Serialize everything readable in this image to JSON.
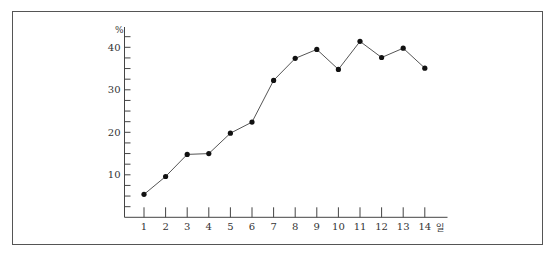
{
  "chart_data": {
    "type": "line",
    "title": "",
    "xlabel": "일",
    "ylabel": "%",
    "categories": [
      "1",
      "2",
      "3",
      "4",
      "5",
      "6",
      "7",
      "8",
      "9",
      "10",
      "11",
      "12",
      "13",
      "14"
    ],
    "x": [
      1,
      2,
      3,
      4,
      5,
      6,
      7,
      8,
      9,
      10,
      11,
      12,
      13,
      14
    ],
    "values": [
      5.4,
      9.6,
      14.8,
      15.0,
      19.8,
      22.4,
      32.2,
      37.4,
      39.5,
      34.8,
      41.4,
      37.6,
      39.8,
      35.1
    ],
    "y_ticks_labeled": [
      10,
      20,
      30,
      40
    ],
    "y_minor_tick_step": 2.5,
    "ylim": [
      0,
      44
    ],
    "xlim": [
      0,
      15
    ],
    "grid": false,
    "legend": null,
    "marker": "filled-circle",
    "line_color": "#555555",
    "marker_color": "#111111",
    "axis_color": "#444444"
  },
  "frame": {
    "border_color": "#555555"
  }
}
